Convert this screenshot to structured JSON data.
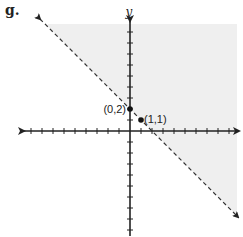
{
  "problem_label": "g.",
  "chart_data": {
    "type": "scatter",
    "title": "",
    "xlabel": "",
    "ylabel": "y",
    "xlim": [
      -10,
      10
    ],
    "ylim": [
      -10,
      10
    ],
    "grid": false,
    "boundary_line": {
      "equation": "y = -x + 2",
      "slope": -1,
      "intercept": 2,
      "style": "dashed",
      "arrows": "both"
    },
    "shaded_region": {
      "inequality": "y > -x + 2",
      "side": "above",
      "color": "#f0f0f0"
    },
    "points": [
      {
        "x": 0,
        "y": 2,
        "label": "(0,2)"
      },
      {
        "x": 1,
        "y": 1,
        "label": "(1,1)"
      }
    ],
    "ticks": {
      "x_step": 1,
      "y_step": 1
    },
    "colors": {
      "axis": "#222222",
      "line": "#333333",
      "shade": "#efefef"
    }
  }
}
